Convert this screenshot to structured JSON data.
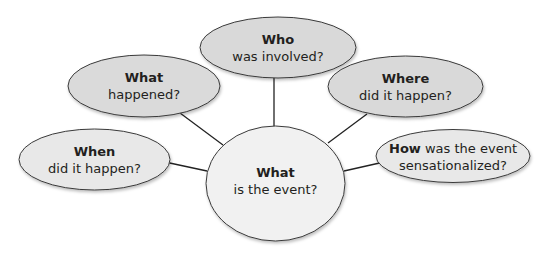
{
  "diagram": {
    "type": "5W1H web / question organizer",
    "center": {
      "bold": "What",
      "text": "is the event?"
    },
    "nodes": {
      "who": {
        "bold": "Who",
        "text": "was involved?"
      },
      "what_happened": {
        "bold": "What",
        "text": "happened?"
      },
      "where": {
        "bold": "Where",
        "text": "did it happen?"
      },
      "when": {
        "bold": "When",
        "text": "did it happen?"
      },
      "how": {
        "bold": "How",
        "text_inline": " was the event",
        "text": "sensationalized?"
      }
    },
    "colors": {
      "outer_fill_dark": "#d9d9d9",
      "outer_fill_light": "#e8e8e8",
      "center_fill": "#f1f1f1",
      "stroke": "#3a3a3a",
      "text": "#231f20"
    }
  }
}
